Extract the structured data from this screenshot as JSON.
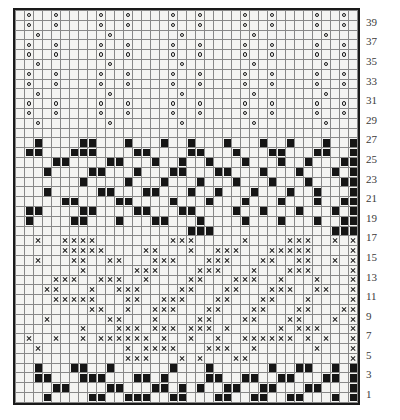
{
  "chart_data": {
    "type": "heatmap",
    "xlabel": "",
    "ylabel": "Row number",
    "grid": true,
    "legend_position": "none",
    "columns": 38,
    "rows": 40,
    "row_numbering": {
      "direction": "bottom-to-top",
      "labelled": "odd rows only",
      "min": 1,
      "max": 39,
      "labels": [
        39,
        37,
        35,
        33,
        31,
        29,
        27,
        25,
        23,
        21,
        19,
        17,
        15,
        13,
        11,
        9,
        7,
        5,
        3,
        1
      ]
    },
    "symbol_key": {
      "empty": "background stitch (no symbol, light cell)",
      "black": "solid black square stitch",
      "circle": "open circle symbol on grey cell",
      "cross": "x symbol on grey cell"
    },
    "colors": {
      "background_cell": "#f4f4f2",
      "symbol_cell": "#9c9c9c",
      "solid": "#151515",
      "gridline": "#888888",
      "border": "#1a1a1a",
      "label_text": "#3a3a3a",
      "page": "#ffffff"
    },
    "bands": [
      {
        "name": "top-circle-band",
        "rows": "29-40",
        "symbol": "circle"
      },
      {
        "name": "upper-black-band",
        "rows": "19-27",
        "symbol": "black"
      },
      {
        "name": "cross-band",
        "rows": "5-17",
        "symbol": "cross"
      },
      {
        "name": "bottom-black-band",
        "rows": "1-4",
        "symbol": "black"
      }
    ],
    "cells": [
      {
        "row": 40,
        "symbol": "circle",
        "cols": [
          2,
          5,
          10,
          13,
          18,
          21,
          26,
          29,
          34,
          37
        ]
      },
      {
        "row": 39,
        "symbol": "circle",
        "cols": [
          2,
          5,
          10,
          13,
          18,
          21,
          26,
          29,
          34,
          37
        ]
      },
      {
        "row": 38,
        "symbol": "circle",
        "cols": [
          3,
          11,
          19,
          27,
          35
        ]
      },
      {
        "row": 37,
        "symbol": "circle",
        "cols": [
          2,
          5,
          10,
          13,
          18,
          21,
          26,
          29,
          34,
          37
        ]
      },
      {
        "row": 36,
        "symbol": "circle",
        "cols": [
          2,
          5,
          10,
          13,
          18,
          21,
          26,
          29,
          34,
          37
        ]
      },
      {
        "row": 35,
        "symbol": "circle",
        "cols": [
          3,
          11,
          19,
          27,
          35
        ]
      },
      {
        "row": 34,
        "symbol": "circle",
        "cols": [
          2,
          5,
          10,
          13,
          18,
          21,
          26,
          29,
          34,
          37
        ]
      },
      {
        "row": 33,
        "symbol": "circle",
        "cols": [
          2,
          5,
          10,
          13,
          18,
          21,
          26,
          29,
          34,
          37
        ]
      },
      {
        "row": 32,
        "symbol": "circle",
        "cols": [
          3,
          11,
          19,
          27,
          35
        ]
      },
      {
        "row": 31,
        "symbol": "circle",
        "cols": [
          2,
          5,
          10,
          13,
          18,
          21,
          26,
          29,
          34,
          37
        ]
      },
      {
        "row": 30,
        "symbol": "circle",
        "cols": [
          2,
          5,
          10,
          13,
          18,
          21,
          26,
          29,
          34,
          37
        ]
      },
      {
        "row": 29,
        "symbol": "circle",
        "cols": [
          3,
          11,
          19,
          27,
          35
        ]
      },
      {
        "row": 28,
        "symbol": "empty",
        "cols": []
      },
      {
        "row": 27,
        "symbol": "black",
        "cols": [
          3,
          8,
          9,
          13,
          17,
          20,
          24,
          28,
          31,
          35,
          38
        ]
      },
      {
        "row": 26,
        "symbol": "black",
        "cols": [
          2,
          3,
          7,
          8,
          9,
          14,
          15,
          20,
          21,
          25,
          29,
          30,
          34,
          35,
          38
        ]
      },
      {
        "row": 25,
        "symbol": "black",
        "cols": [
          5,
          6,
          11,
          12,
          16,
          19,
          22,
          26,
          30,
          33,
          37,
          38
        ]
      },
      {
        "row": 24,
        "symbol": "black",
        "cols": [
          4,
          9,
          10,
          14,
          18,
          19,
          23,
          24,
          28,
          32,
          36,
          38
        ]
      },
      {
        "row": 23,
        "symbol": "black",
        "cols": [
          8,
          13,
          17,
          21,
          25,
          29,
          33,
          37,
          38
        ]
      },
      {
        "row": 22,
        "symbol": "black",
        "cols": [
          4,
          10,
          11,
          15,
          16,
          20,
          23,
          27,
          31,
          34,
          38
        ]
      },
      {
        "row": 21,
        "symbol": "black",
        "cols": [
          6,
          7,
          12,
          13,
          18,
          22,
          26,
          30,
          34,
          37,
          38
        ]
      },
      {
        "row": 20,
        "symbol": "black",
        "cols": [
          2,
          3,
          8,
          9,
          14,
          15,
          19,
          20,
          25,
          28,
          32,
          36,
          38
        ]
      },
      {
        "row": 19,
        "symbol": "black",
        "cols": [
          2,
          7,
          8,
          12,
          16,
          17,
          21,
          26,
          30,
          34,
          37,
          38
        ]
      },
      {
        "row": 18,
        "symbol": "black",
        "cols": [
          20,
          21,
          22,
          36,
          37,
          38
        ]
      },
      {
        "row": 17,
        "symbol": "cross",
        "cols": [
          3,
          6,
          7,
          8,
          9,
          18,
          19,
          20,
          26,
          31,
          32,
          33,
          36,
          38
        ]
      },
      {
        "row": 16,
        "symbol": "cross",
        "cols": [
          6,
          7,
          8,
          9,
          10,
          15,
          16,
          20,
          23,
          24,
          25,
          29,
          30,
          31,
          32,
          33,
          38
        ]
      },
      {
        "row": 15,
        "symbol": "cross",
        "cols": [
          3,
          7,
          8,
          11,
          12,
          16,
          17,
          18,
          22,
          23,
          24,
          28,
          29,
          32,
          33,
          36,
          38
        ]
      },
      {
        "row": 14,
        "symbol": "cross",
        "cols": [
          8,
          14,
          15,
          16,
          21,
          22,
          23,
          27,
          31,
          32,
          33,
          38
        ]
      },
      {
        "row": 13,
        "symbol": "cross",
        "cols": [
          5,
          6,
          7,
          10,
          11,
          12,
          15,
          20,
          21,
          25,
          26,
          27,
          30,
          34,
          38
        ]
      },
      {
        "row": 12,
        "symbol": "cross",
        "cols": [
          4,
          5,
          9,
          12,
          13,
          14,
          19,
          20,
          24,
          25,
          29,
          30,
          31,
          34,
          35,
          38
        ]
      },
      {
        "row": 11,
        "symbol": "cross",
        "cols": [
          5,
          6,
          7,
          8,
          9,
          13,
          14,
          17,
          18,
          19,
          23,
          24,
          28,
          29,
          33,
          38
        ]
      },
      {
        "row": 10,
        "symbol": "cross",
        "cols": [
          9,
          10,
          13,
          16,
          17,
          18,
          22,
          23,
          27,
          28,
          32,
          33,
          37,
          38
        ]
      },
      {
        "row": 9,
        "symbol": "cross",
        "cols": [
          4,
          11,
          12,
          16,
          21,
          22,
          26,
          27,
          31,
          32,
          36,
          38
        ]
      },
      {
        "row": 8,
        "symbol": "cross",
        "cols": [
          8,
          12,
          13,
          14,
          16,
          17,
          18,
          20,
          21,
          22,
          24,
          30,
          32,
          33,
          34,
          38
        ]
      },
      {
        "row": 7,
        "symbol": "cross",
        "cols": [
          2,
          5,
          8,
          10,
          11,
          12,
          13,
          14,
          15,
          17,
          20,
          23,
          26,
          27,
          28,
          29,
          30,
          31,
          33,
          35,
          38
        ]
      },
      {
        "row": 6,
        "symbol": "cross",
        "cols": [
          3,
          13,
          15,
          16,
          17,
          18,
          22,
          23,
          24,
          27,
          34,
          38
        ]
      },
      {
        "row": 5,
        "symbol": "cross",
        "cols": [
          13,
          14,
          15,
          19,
          21,
          25,
          26,
          38
        ]
      },
      {
        "row": 4,
        "symbol": "black",
        "cols": [
          3,
          7,
          8,
          11,
          18,
          22,
          29,
          32,
          33,
          36,
          38
        ]
      },
      {
        "row": 3,
        "symbol": "black",
        "cols": [
          3,
          4,
          8,
          9,
          10,
          14,
          15,
          17,
          22,
          23,
          26,
          27,
          30,
          31,
          35,
          36,
          38
        ]
      },
      {
        "row": 2,
        "symbol": "black",
        "cols": [
          5,
          6,
          11,
          12,
          16,
          17,
          19,
          21,
          24,
          25,
          28,
          29,
          33,
          34,
          38
        ]
      },
      {
        "row": 1,
        "symbol": "black",
        "cols": [
          4,
          9,
          10,
          13,
          14,
          15,
          18,
          19,
          23,
          24,
          27,
          28,
          31,
          32,
          36,
          38
        ]
      }
    ]
  }
}
